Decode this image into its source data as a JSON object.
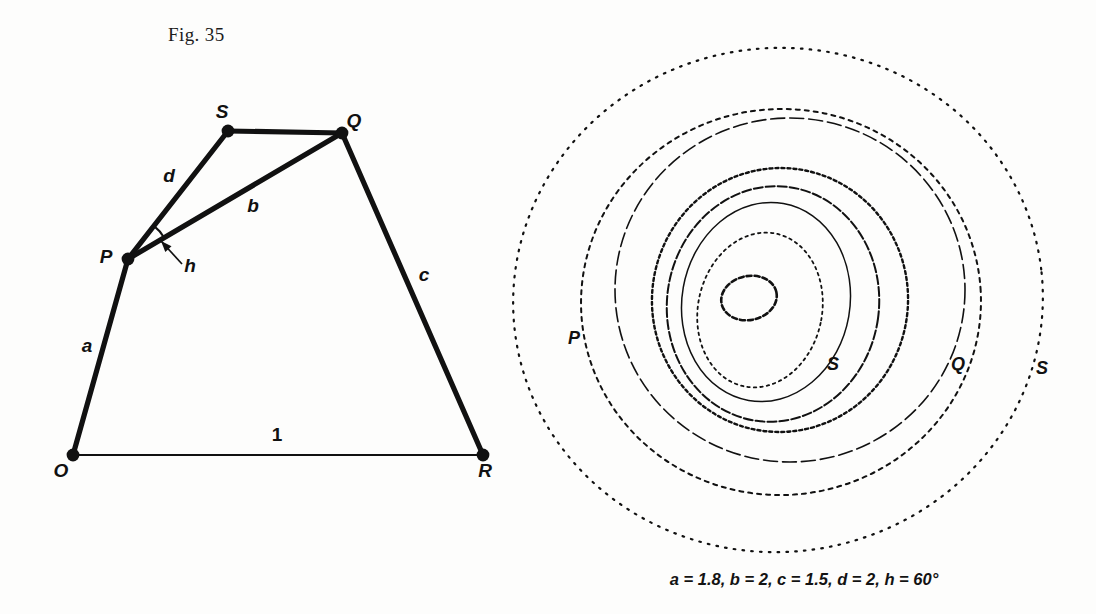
{
  "figure": {
    "number_label": "Fig. 35",
    "caption": "a = 1.8, b = 2, c = 1.5, d = 2, h = 60°"
  },
  "linkage": {
    "vertices": [
      {
        "name": "O",
        "label": "O",
        "x": 73,
        "y": 455
      },
      {
        "name": "P",
        "label": "P",
        "x": 128,
        "y": 259
      },
      {
        "name": "S",
        "label": "S",
        "x": 228,
        "y": 131
      },
      {
        "name": "Q",
        "label": "Q",
        "x": 342,
        "y": 133
      },
      {
        "name": "R",
        "label": "R",
        "x": 483,
        "y": 455
      }
    ],
    "vertex_label_offsets": [
      {
        "name": "O",
        "dx": -12,
        "dy": 22
      },
      {
        "name": "P",
        "dx": -22,
        "dy": 4
      },
      {
        "name": "S",
        "dx": -6,
        "dy": -13
      },
      {
        "name": "Q",
        "dx": 12,
        "dy": -6
      },
      {
        "name": "R",
        "dx": 2,
        "dy": 22
      }
    ],
    "links": [
      {
        "name": "a",
        "from": "O",
        "to": "P",
        "label": "a",
        "label_x": 87,
        "label_y": 352
      },
      {
        "name": "d",
        "from": "P",
        "to": "S",
        "label": "d",
        "label_x": 169,
        "label_y": 182
      },
      {
        "name": "b",
        "from": "P",
        "to": "Q",
        "label": "b",
        "label_x": 253,
        "label_y": 212
      },
      {
        "name": "c",
        "from": "Q",
        "to": "R",
        "label": "c",
        "label_x": 424,
        "label_y": 281
      },
      {
        "name": "SQ",
        "from": "S",
        "to": "Q",
        "label": "",
        "label_x": 0,
        "label_y": 0
      },
      {
        "name": "ground",
        "from": "O",
        "to": "R",
        "label": "1",
        "label_x": 277,
        "label_y": 441
      }
    ],
    "angle": {
      "name": "h",
      "label": "h",
      "label_x": 190,
      "label_y": 272,
      "arrow_from_x": 182,
      "arrow_from_y": 264,
      "arrow_to_x": 161,
      "arrow_to_y": 241
    }
  },
  "coupler_curves": {
    "center_x": 783,
    "center_y": 300,
    "labels": [
      {
        "name": "curve-label-p",
        "text": "P",
        "x": 574,
        "y": 344
      },
      {
        "name": "curve-label-s-inner",
        "text": "S",
        "x": 833,
        "y": 370
      },
      {
        "name": "curve-label-q",
        "text": "Q",
        "x": 958,
        "y": 370
      },
      {
        "name": "curve-label-s-outer",
        "text": "S",
        "x": 1042,
        "y": 374
      }
    ],
    "curves": [
      {
        "name": "outer-s-curve",
        "rx": 265,
        "ry": 252,
        "cx": 778,
        "cy": 300,
        "rot": -6,
        "dash": "1.6 7.2",
        "width": 2.2
      },
      {
        "name": "q-curve",
        "rx": 200,
        "ry": 193,
        "cx": 781,
        "cy": 302,
        "rot": -4,
        "dash": "4 5",
        "width": 2.0
      },
      {
        "name": "p-curve",
        "rx": 175,
        "ry": 172,
        "cx": 790,
        "cy": 290,
        "rot": 0,
        "dash": "14 5",
        "width": 1.6
      },
      {
        "name": "mid-curve-1",
        "rx": 128,
        "ry": 132,
        "cx": 780,
        "cy": 300,
        "rot": 6,
        "dash": "3 3",
        "width": 2.4
      },
      {
        "name": "mid-curve-2",
        "rx": 106,
        "ry": 118,
        "cx": 773,
        "cy": 304,
        "rot": 8,
        "dash": "9 3",
        "width": 2.0
      },
      {
        "name": "s-curve-inner",
        "rx": 84,
        "ry": 100,
        "cx": 766,
        "cy": 302,
        "rot": 10,
        "dash": "none",
        "width": 1.5
      },
      {
        "name": "small-curve",
        "rx": 62,
        "ry": 78,
        "cx": 760,
        "cy": 310,
        "rot": 12,
        "dash": "2.5 4",
        "width": 1.8
      },
      {
        "name": "innermost-loop",
        "rx": 28,
        "ry": 22,
        "cx": 749,
        "cy": 298,
        "rot": -12,
        "dash": "5 3",
        "width": 2.6
      }
    ]
  },
  "colors": {
    "ink": "#111111",
    "paper": "#fdfdfc"
  }
}
